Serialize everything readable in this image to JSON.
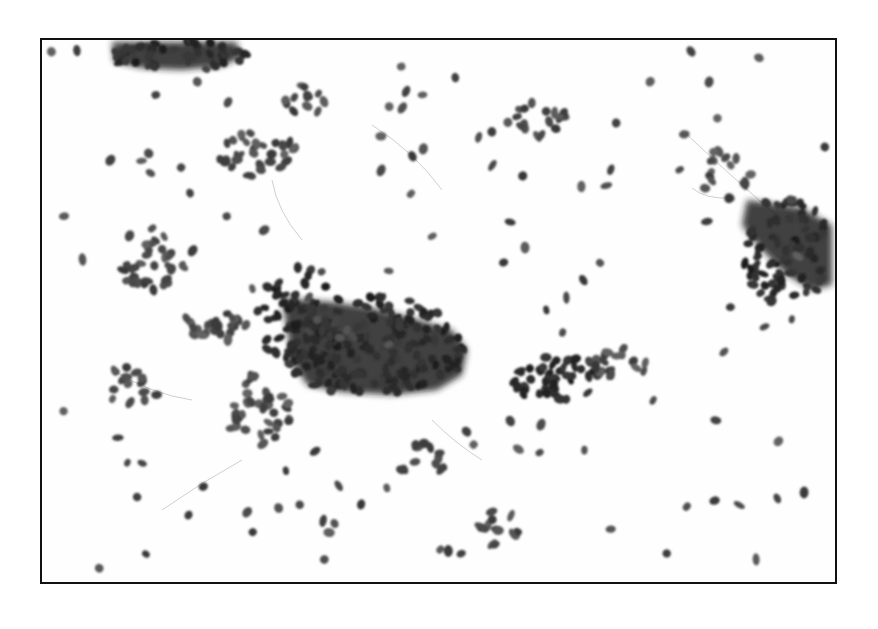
{
  "image": {
    "kind": "micrograph",
    "description": "Grayscale cytology micrograph showing scattered dark oval nuclei and dense cell clusters on a white background, enclosed in a thin black frame",
    "caption": "",
    "colors": {
      "background": "#ffffff",
      "frame": "#111111",
      "nucleus": "#4a4a4a",
      "dense_cluster": "#1e1e1e",
      "faint_strand": "#9a9a9a"
    },
    "regions": [
      {
        "name": "top-left-cluster",
        "density": "high"
      },
      {
        "name": "central-large-cluster",
        "density": "very-high"
      },
      {
        "name": "right-edge-cluster",
        "density": "high"
      },
      {
        "name": "center-right-cluster",
        "density": "medium"
      },
      {
        "name": "left-small-cluster",
        "density": "medium"
      },
      {
        "name": "scattered-cells",
        "density": "low"
      }
    ]
  }
}
